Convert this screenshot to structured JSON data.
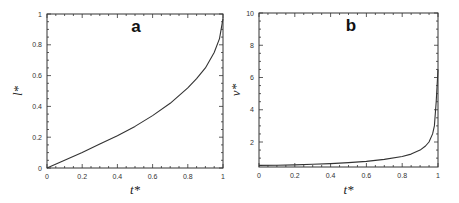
{
  "chart_data": [
    {
      "type": "line",
      "panel_label": "a",
      "xlabel": "t*",
      "ylabel": "l*",
      "xlim": [
        0,
        1
      ],
      "ylim": [
        0,
        1
      ],
      "xticks": [
        "0",
        "0.2",
        "0.4",
        "0.6",
        "0.8",
        "1"
      ],
      "yticks": [
        "0",
        "0.2",
        "0.4",
        "0.6",
        "0.8",
        "1"
      ],
      "grid": false,
      "series": [
        {
          "name": "l*(t*)",
          "x": [
            0,
            0.1,
            0.2,
            0.3,
            0.4,
            0.5,
            0.6,
            0.7,
            0.8,
            0.85,
            0.9,
            0.95,
            0.98,
            1.0
          ],
          "y": [
            0,
            0.05,
            0.1,
            0.155,
            0.21,
            0.27,
            0.34,
            0.42,
            0.52,
            0.58,
            0.65,
            0.75,
            0.84,
            0.97
          ]
        }
      ]
    },
    {
      "type": "line",
      "panel_label": "b",
      "xlabel": "t*",
      "ylabel": "v*",
      "xlim": [
        0,
        1
      ],
      "ylim": [
        0.45,
        10
      ],
      "xticks": [
        "0",
        "0.2",
        "0.4",
        "0.6",
        "0.8",
        "1"
      ],
      "yticks": [
        "2",
        "4",
        "6",
        "8",
        "10"
      ],
      "grid": false,
      "series": [
        {
          "name": "v*(t*)",
          "x": [
            0,
            0.1,
            0.2,
            0.3,
            0.4,
            0.5,
            0.6,
            0.7,
            0.8,
            0.85,
            0.9,
            0.93,
            0.95,
            0.97,
            0.98,
            0.99,
            1.0
          ],
          "y": [
            0.55,
            0.56,
            0.58,
            0.62,
            0.66,
            0.72,
            0.8,
            0.92,
            1.1,
            1.25,
            1.5,
            1.75,
            2.0,
            2.5,
            3.0,
            4.5,
            6.5
          ]
        }
      ]
    }
  ]
}
